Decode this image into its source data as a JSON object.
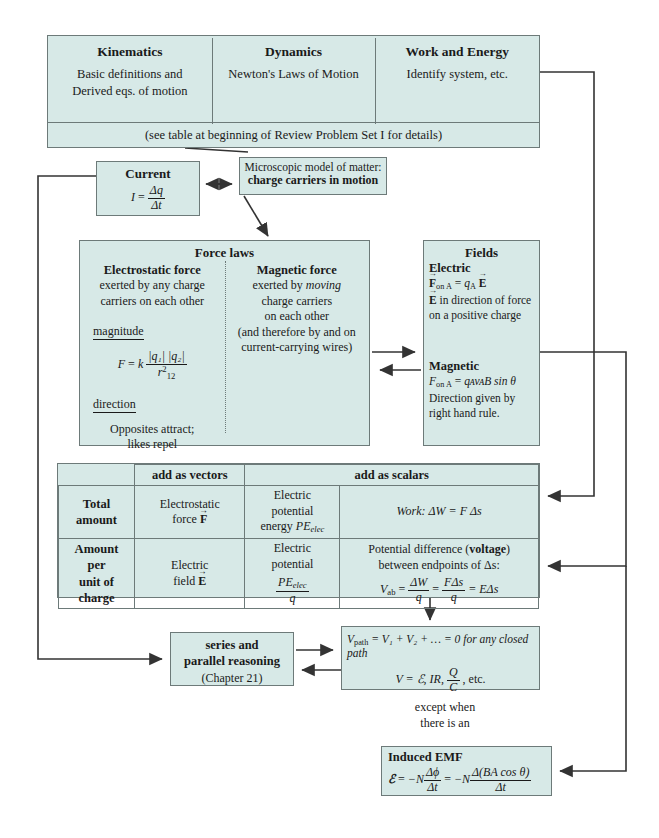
{
  "colors": {
    "box_fill": "#d7e9e7",
    "box_border": "#6d7a79",
    "line": "#333333",
    "page": "#ffffff"
  },
  "top_banner": {
    "columns": [
      {
        "title": "Kinematics",
        "line1": "Basic definitions and",
        "line2": "Derived eqs. of motion"
      },
      {
        "title": "Dynamics",
        "line1": "Newton's Laws of Motion",
        "line2": ""
      },
      {
        "title": "Work and Energy",
        "line1": "Identify system, etc.",
        "line2": ""
      }
    ],
    "footnote": "(see table at beginning of Review Problem Set I for details)"
  },
  "current": {
    "title": "Current",
    "eq_lhs": "I",
    "eq_eq": "=",
    "eq_num": "Δq",
    "eq_den": "Δt"
  },
  "microscopic": {
    "line1": "Microscopic model of matter:",
    "line2": "charge carriers in motion"
  },
  "force_laws": {
    "title": "Force laws",
    "electrostatic": {
      "title": "Electrostatic force",
      "line1": "exerted by any charge",
      "line2": "carriers on each other",
      "magnitude_label": "magnitude",
      "eq_lhs": "F",
      "eq_eq": "=",
      "eq_k": "k",
      "eq_num": "|q₁| |q₂|",
      "eq_den_base": "r",
      "eq_den_sub": "12",
      "eq_den_sup": "2",
      "direction_label": "direction",
      "dir_line1": "Opposites attract;",
      "dir_line2": "likes repel"
    },
    "magnetic": {
      "title": "Magnetic force",
      "line1_pre": "exerted by ",
      "line1_em": "moving",
      "line2": "charge carriers",
      "line3": "on each other",
      "line4": "(and therefore by and on",
      "line5": "current-carrying wires)"
    }
  },
  "fields": {
    "title": "Fields",
    "electric": {
      "label": "Electric",
      "eq": "Fₒₙ ₐ = qₐ E",
      "eq_F": "F",
      "eq_F_sub": "on A",
      "eq_eq": "=",
      "eq_q": "q",
      "eq_q_sub": "A",
      "eq_E": "E",
      "line2_E": "E",
      "line2": "in direction of force",
      "line3": "on a positive charge"
    },
    "magnetic": {
      "label": "Magnetic",
      "eq_F": "F",
      "eq_F_sub": "on A",
      "eq_eq": "=",
      "eq_rest": "qᴀvᴀB sin θ",
      "line2": "Direction given by",
      "line3": "right hand rule."
    }
  },
  "comparison_table": {
    "col_headers": [
      "",
      "add as vectors",
      "add as scalars"
    ],
    "header_vectors": "add as vectors",
    "header_scalars": "add as scalars",
    "rows": [
      {
        "label": "Total\namount",
        "label_line1": "Total",
        "label_line2": "amount",
        "vectors": {
          "line1": "Electrostatic",
          "line2_pre": "force ",
          "line2_vec": "F"
        },
        "scalars_a": {
          "line1": "Electric",
          "line2": "potential",
          "line3_pre": "energy ",
          "line3_it": "PE",
          "line3_sub": "elec"
        },
        "scalars_b": {
          "text": "Work:  ΔW = F Δs"
        }
      },
      {
        "label_line1": "Amount",
        "label_line2": "per",
        "label_line3": "unit of",
        "label_line4": "charge",
        "vectors": {
          "line1": "Electric",
          "line2_pre": "field ",
          "line2_vec": "E"
        },
        "scalars_a": {
          "line1": "Electric",
          "line2": "potential",
          "frac_num_it": "PE",
          "frac_num_sub": "elec",
          "frac_den": "q"
        },
        "scalars_b": {
          "line1_pre": "Potential difference (",
          "line1_bold": "voltage",
          "line1_post": ")",
          "line2": "between endpoints of Δs:",
          "eq_lhs": "V",
          "eq_lhs_sub": "ab",
          "f1_num": "ΔW",
          "f1_den": "q",
          "f2_num": "FΔs",
          "f2_den": "q",
          "tail": "= EΔs"
        }
      }
    ]
  },
  "series_parallel": {
    "line1": "series and",
    "line2": "parallel reasoning",
    "line3": "(Chapter 21)"
  },
  "loop_rule": {
    "eq1_lhs": "V",
    "eq1_lhs_sub": "path",
    "eq1_rest": "= V₁ + V₂ + … = 0 for any closed path",
    "eq2_pre": "V = ℰ, IR, ",
    "eq2_frac_num": "Q",
    "eq2_frac_den": "C",
    "eq2_post": ", etc."
  },
  "except_label": {
    "line1": "except when",
    "line2": "there is an"
  },
  "induced_emf": {
    "title": "Induced EMF",
    "eq_lhs": "ℰ",
    "eq_eq": "=",
    "eq_neg_N1": "−N",
    "f1_num": "Δϕ",
    "f1_den": "Δt",
    "eq_mid": "=",
    "eq_neg_N2": "−N",
    "f2_num": "Δ(BA cos θ)",
    "f2_den": "Δt"
  },
  "connectors": [
    {
      "name": "work-energy-to-right-rail",
      "desc": "Work and Energy box right edge to right vertical rail down to comparison table"
    },
    {
      "name": "top-banner-to-microscopic",
      "desc": "diagonal from bottom of top banner down to microscopic model box"
    },
    {
      "name": "current-microscopic-bidirectional",
      "desc": "double arrow between Current and Microscopic model"
    },
    {
      "name": "microscopic-to-force-laws",
      "desc": "diagonal arrow into Force laws box"
    },
    {
      "name": "force-laws-fields-bidirectional",
      "desc": "double arrow between Force laws and Fields"
    },
    {
      "name": "fields-to-table-rail",
      "desc": "Fields right edge to far right rail down to Amount-per-charge row"
    },
    {
      "name": "current-left-rail-to-series",
      "desc": "Current left edge down left rail to series and parallel reasoning"
    },
    {
      "name": "table-to-loop-rule",
      "desc": "comparison table down into loop rule box"
    },
    {
      "name": "series-loop-bidirectional",
      "desc": "double arrow between series/parallel and loop rule"
    },
    {
      "name": "right-rail-to-induced-emf",
      "desc": "far right rail down into Induced EMF box"
    }
  ]
}
